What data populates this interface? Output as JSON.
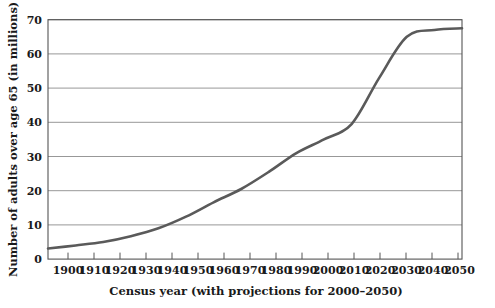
{
  "chart_data": {
    "type": "line",
    "title": "",
    "xlabel": "Census year (with projections for 2000–2050)",
    "ylabel": "Number of adults over age 65 (in millions)",
    "xlim": [
      1900,
      2050
    ],
    "ylim": [
      0,
      70
    ],
    "grid": true,
    "legend_position": "none",
    "xticks": [
      "1900",
      "1910",
      "1920",
      "1930",
      "1940",
      "1950",
      "1960",
      "1970",
      "1980",
      "1990",
      "2000",
      "2010",
      "2020",
      "2030",
      "2040",
      "2050"
    ],
    "yticks": [
      "0",
      "10",
      "20",
      "30",
      "40",
      "50",
      "60",
      "70"
    ],
    "series": [
      {
        "name": "Adults over age 65",
        "color": "#5a5a5a",
        "x": [
          1900,
          1910,
          1920,
          1930,
          1940,
          1950,
          1960,
          1970,
          1980,
          1990,
          2000,
          2010,
          2020,
          2030,
          2040,
          2050
        ],
        "values": [
          3.1,
          4.0,
          5.0,
          6.7,
          9.0,
          12.4,
          16.6,
          20.5,
          25.5,
          31.0,
          35.0,
          39.5,
          53.0,
          65.0,
          67.0,
          67.5
        ]
      }
    ]
  },
  "axis": {
    "x_title": "Census year (with projections for 2000–2050)",
    "y_title": "Number of adults over age 65 (in millions)"
  },
  "colors": {
    "curve": "#5a5a5a",
    "grid": "#8c8c8c",
    "frame": "#555555",
    "text": "#1a1a1a",
    "background": "#ffffff"
  }
}
